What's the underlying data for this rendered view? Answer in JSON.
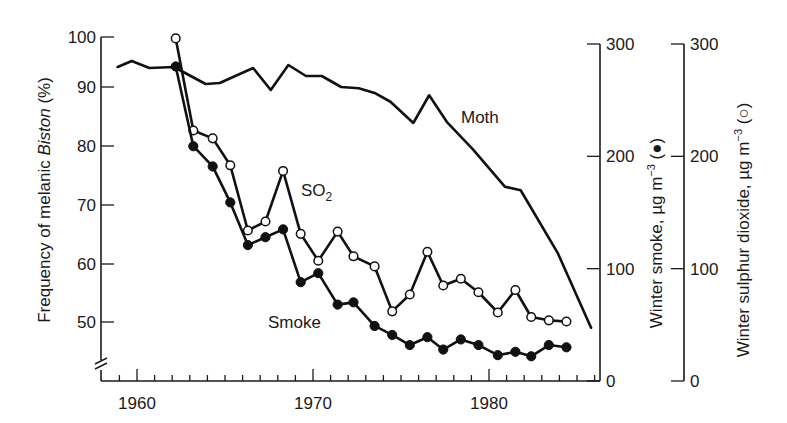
{
  "chart_data": {
    "type": "line",
    "title": "",
    "xlabel": "",
    "x_ticks": [
      1960,
      1970,
      1980
    ],
    "xlim": [
      1958.2,
      1986.4
    ],
    "axes": {
      "left": {
        "label_prefix": "Frequency of melanic ",
        "label_italic": "Biston",
        "label_suffix": " (%)",
        "ticks": [
          50,
          60,
          70,
          80,
          90,
          100
        ],
        "ylim": [
          45,
          100
        ],
        "broken": true
      },
      "right_smoke": {
        "label_prefix": "Winter smoke, µg m",
        "label_sup": "−3",
        "label_suffix": " (●)",
        "ticks": [
          0,
          100,
          200,
          300
        ],
        "ylim": [
          0,
          300
        ]
      },
      "right_so2": {
        "label_prefix": "Winter sulphur dioxide, µg m",
        "label_sup": "−3",
        "label_suffix": " (○)",
        "ticks": [
          0,
          100,
          200,
          300
        ],
        "ylim": [
          0,
          300
        ]
      }
    },
    "series": [
      {
        "name": "Moth",
        "axis": "left",
        "marker": "none",
        "x": [
          1958.9,
          1959.7,
          1960.7,
          1962.1,
          1963.9,
          1964.7,
          1966.6,
          1967.6,
          1968.6,
          1969.6,
          1970.5,
          1971.6,
          1972.6,
          1973.5,
          1974.4,
          1975.7,
          1976.6,
          1977.6,
          1979.1,
          1980.9,
          1981.8,
          1983.9,
          1985.8
        ],
        "values": [
          94.0,
          95.2,
          93.8,
          94.0,
          90.6,
          90.8,
          93.8,
          89.5,
          94.4,
          92.2,
          92.2,
          90.0,
          89.8,
          89.0,
          87.5,
          83.9,
          88.6,
          84.1,
          79.4,
          73.1,
          72.5,
          61.9,
          49.0
        ]
      },
      {
        "name": "SO2",
        "axis": "right_so2",
        "marker": "open-circle",
        "x": [
          1962.2,
          1963.2,
          1964.3,
          1965.3,
          1966.3,
          1967.3,
          1968.3,
          1969.3,
          1970.3,
          1971.4,
          1972.3,
          1973.5,
          1974.5,
          1975.5,
          1976.5,
          1977.4,
          1978.4,
          1979.4,
          1980.5,
          1981.5,
          1982.4,
          1983.4,
          1984.4
        ],
        "values": [
          305,
          223,
          216,
          192,
          134,
          142,
          187,
          131,
          107,
          133,
          111,
          102,
          62,
          77,
          115,
          85,
          91,
          79,
          61,
          81,
          57,
          54,
          53
        ]
      },
      {
        "name": "Smoke",
        "axis": "right_smoke",
        "marker": "filled-circle",
        "x": [
          1962.2,
          1963.2,
          1964.3,
          1965.3,
          1966.3,
          1967.3,
          1968.3,
          1969.3,
          1970.3,
          1971.4,
          1972.3,
          1973.5,
          1974.5,
          1975.5,
          1976.5,
          1977.4,
          1978.4,
          1979.4,
          1980.5,
          1981.5,
          1982.4,
          1983.4,
          1984.4
        ],
        "values": [
          280,
          209,
          191,
          159,
          121,
          128,
          135,
          88,
          96,
          68,
          70,
          49,
          41,
          32,
          39,
          28,
          37,
          32,
          23,
          26,
          22,
          32,
          30
        ]
      }
    ],
    "annotations": [
      {
        "text": "Moth",
        "series": "Moth"
      },
      {
        "text": "SO",
        "sub": "2",
        "series": "SO2"
      },
      {
        "text": "Smoke",
        "series": "Smoke"
      }
    ],
    "grid": false,
    "legend": "inline labels"
  },
  "labels": {
    "moth": "Moth",
    "so2_main": "SO",
    "so2_sub": "2",
    "smoke": "Smoke",
    "left_title_prefix": "Frequency of melanic ",
    "left_title_italic": "Biston",
    "left_title_suffix": " (%)",
    "smoke_title_prefix": "Winter smoke, µg m",
    "smoke_title_sup": "−3",
    "smoke_title_suffix": " (●)",
    "so2_title_prefix": "Winter sulphur dioxide, µg m",
    "so2_title_sup": "−3",
    "so2_title_suffix": " (○)"
  },
  "colors": {
    "ink": "#111111",
    "background": "#ffffff"
  }
}
